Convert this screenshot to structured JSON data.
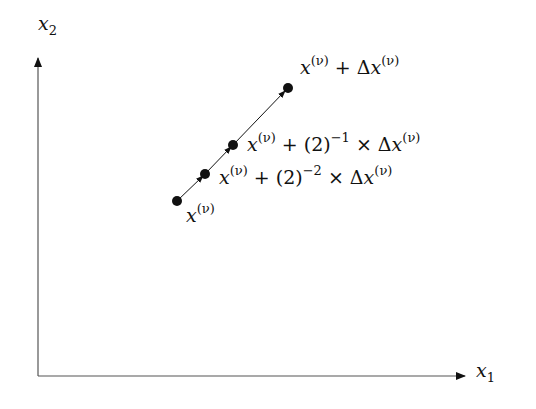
{
  "axes": {
    "x_label": {
      "var": "x",
      "sub": "1"
    },
    "y_label": {
      "var": "x",
      "sub": "2"
    }
  },
  "points": [
    {
      "x": 177,
      "y": 201,
      "label": {
        "var": "x",
        "sup": "(ν)",
        "rest": ""
      }
    },
    {
      "x": 205,
      "y": 174,
      "label": {
        "var": "x",
        "sup": "(ν)",
        "rest": " + (2)",
        "exp": "−2",
        "tail": " × Δ",
        "var2": "x",
        "sup2": "(ν)"
      }
    },
    {
      "x": 233,
      "y": 145,
      "label": {
        "var": "x",
        "sup": "(ν)",
        "rest": " + (2)",
        "exp": "−1",
        "tail": " × Δ",
        "var2": "x",
        "sup2": "(ν)"
      }
    },
    {
      "x": 288,
      "y": 88,
      "label": {
        "var": "x",
        "sup": "(ν)",
        "rest": " + Δ",
        "var2": "x",
        "sup2": "(ν)"
      }
    }
  ],
  "colors": {
    "ink": "#111111",
    "axis": "#555555"
  }
}
